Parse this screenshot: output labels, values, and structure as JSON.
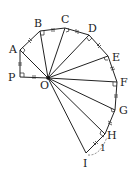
{
  "diagram": {
    "center": {
      "name": "O",
      "x": 48,
      "y": 78,
      "label_x": 40,
      "label_y": 89
    },
    "points": [
      {
        "name": "P",
        "x": 20,
        "y": 77,
        "label_x": 8,
        "label_y": 81
      },
      {
        "name": "A",
        "x": 20,
        "y": 50,
        "label_x": 9,
        "label_y": 53
      },
      {
        "name": "B",
        "x": 40,
        "y": 31,
        "label_x": 34,
        "label_y": 27
      },
      {
        "name": "C",
        "x": 65,
        "y": 28,
        "label_x": 61,
        "label_y": 23
      },
      {
        "name": "D",
        "x": 89,
        "y": 35,
        "label_x": 88,
        "label_y": 32
      },
      {
        "name": "E",
        "x": 108,
        "y": 56,
        "label_x": 112,
        "label_y": 61
      },
      {
        "name": "F",
        "x": 117,
        "y": 82,
        "label_x": 120,
        "label_y": 86
      },
      {
        "name": "G",
        "x": 115,
        "y": 110,
        "label_x": 119,
        "label_y": 114
      },
      {
        "name": "H",
        "x": 105,
        "y": 134,
        "label_x": 107,
        "label_y": 139
      },
      {
        "name": "I",
        "x": 86,
        "y": 153,
        "label_x": 83,
        "label_y": 167
      }
    ],
    "unit_label": {
      "text": "1",
      "x": 100,
      "y": 150
    },
    "color": "#222222"
  }
}
